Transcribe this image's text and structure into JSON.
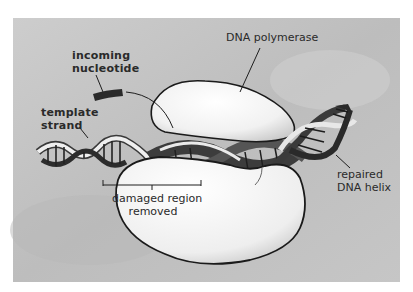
{
  "diagram": {
    "background_color": "#c4c4c4",
    "frame": {
      "left": 13,
      "top": 18,
      "right": 400,
      "bottom": 282
    },
    "labels": {
      "dna_polymerase": "DNA polymerase",
      "incoming_nucleotide": [
        "incoming",
        "nucleotide"
      ],
      "template_strand": [
        "template",
        "strand"
      ],
      "damaged_region": [
        "damaged region",
        "removed"
      ],
      "repaired_helix": [
        "repaired",
        "DNA helix"
      ]
    },
    "components": [
      "DNA polymerase enzyme (upper lobe)",
      "DNA polymerase enzyme (lower lobe)",
      "template strand (left, single-strand helix)",
      "incoming nucleotide (dark bar)",
      "repaired DNA double helix (right)",
      "damaged region bracket"
    ]
  }
}
